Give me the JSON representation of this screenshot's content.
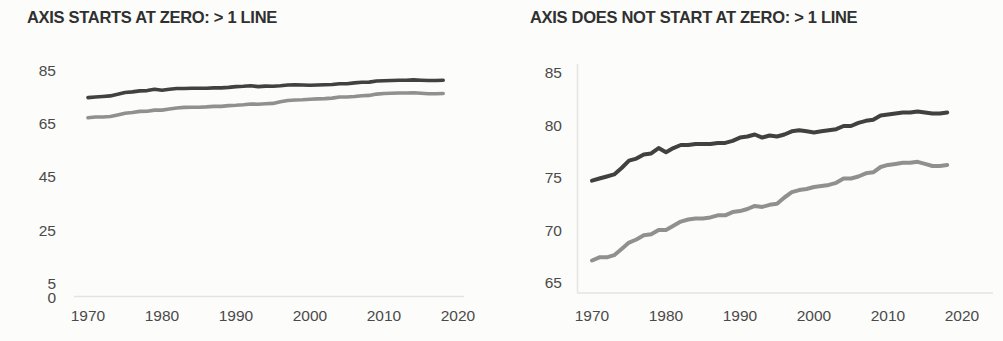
{
  "page": {
    "background_color": "#fcfcfa"
  },
  "chart_data": [
    {
      "id": "axis-starts-at-zero",
      "type": "line",
      "title": "AXIS STARTS AT ZERO: > 1 LINE",
      "xlabel": "",
      "ylabel": "",
      "xlim": [
        1970,
        2020
      ],
      "ylim": [
        0,
        88
      ],
      "x_ticks": [
        1970,
        1980,
        1990,
        2000,
        2010,
        2020
      ],
      "y_ticks": [
        85,
        65,
        45,
        25,
        5,
        0
      ],
      "grid": false,
      "legend": "none",
      "axis_color": "#e4e4e0",
      "tick_color": "#4a4a4a",
      "title_color": "#303030",
      "x": [
        1970,
        1971,
        1972,
        1973,
        1974,
        1975,
        1976,
        1977,
        1978,
        1979,
        1980,
        1981,
        1982,
        1983,
        1984,
        1985,
        1986,
        1987,
        1988,
        1989,
        1990,
        1991,
        1992,
        1993,
        1994,
        1995,
        1996,
        1997,
        1998,
        1999,
        2000,
        2001,
        2002,
        2003,
        2004,
        2005,
        2006,
        2007,
        2008,
        2009,
        2010,
        2011,
        2012,
        2013,
        2014,
        2015,
        2016,
        2017,
        2018
      ],
      "series": [
        {
          "name": "dark-line",
          "color": "#414141",
          "stroke_width": 3.6,
          "values": [
            74.7,
            74.9,
            75.1,
            75.3,
            75.9,
            76.6,
            76.8,
            77.2,
            77.3,
            77.8,
            77.4,
            77.8,
            78.1,
            78.1,
            78.2,
            78.2,
            78.2,
            78.3,
            78.3,
            78.5,
            78.8,
            78.9,
            79.1,
            78.8,
            79.0,
            78.9,
            79.1,
            79.4,
            79.5,
            79.4,
            79.3,
            79.4,
            79.5,
            79.6,
            79.9,
            79.9,
            80.2,
            80.4,
            80.5,
            80.9,
            81.0,
            81.1,
            81.2,
            81.2,
            81.3,
            81.2,
            81.1,
            81.1,
            81.2
          ]
        },
        {
          "name": "light-line",
          "color": "#909090",
          "stroke_width": 3.6,
          "values": [
            67.1,
            67.4,
            67.4,
            67.6,
            68.2,
            68.8,
            69.1,
            69.5,
            69.6,
            70.0,
            70.0,
            70.4,
            70.8,
            71.0,
            71.1,
            71.1,
            71.2,
            71.4,
            71.4,
            71.7,
            71.8,
            72.0,
            72.3,
            72.2,
            72.4,
            72.5,
            73.1,
            73.6,
            73.8,
            73.9,
            74.1,
            74.2,
            74.3,
            74.5,
            74.9,
            74.9,
            75.1,
            75.4,
            75.5,
            76.0,
            76.2,
            76.3,
            76.4,
            76.4,
            76.5,
            76.3,
            76.1,
            76.1,
            76.2
          ]
        }
      ]
    },
    {
      "id": "axis-does-not-start-at-zero",
      "type": "line",
      "title": "AXIS DOES NOT START AT ZERO: > 1 LINE",
      "xlabel": "",
      "ylabel": "",
      "xlim": [
        1970,
        2020
      ],
      "ylim": [
        64.5,
        86
      ],
      "x_ticks": [
        1970,
        1980,
        1990,
        2000,
        2010,
        2020
      ],
      "y_ticks": [
        85,
        80,
        75,
        70,
        65
      ],
      "grid": false,
      "legend": "none",
      "axis_color": "#e4e4e0",
      "tick_color": "#4a4a4a",
      "title_color": "#303030",
      "x": [
        1970,
        1971,
        1972,
        1973,
        1974,
        1975,
        1976,
        1977,
        1978,
        1979,
        1980,
        1981,
        1982,
        1983,
        1984,
        1985,
        1986,
        1987,
        1988,
        1989,
        1990,
        1991,
        1992,
        1993,
        1994,
        1995,
        1996,
        1997,
        1998,
        1999,
        2000,
        2001,
        2002,
        2003,
        2004,
        2005,
        2006,
        2007,
        2008,
        2009,
        2010,
        2011,
        2012,
        2013,
        2014,
        2015,
        2016,
        2017,
        2018
      ],
      "series": [
        {
          "name": "dark-line",
          "color": "#414141",
          "stroke_width": 4,
          "values": [
            74.7,
            74.9,
            75.1,
            75.3,
            75.9,
            76.6,
            76.8,
            77.2,
            77.3,
            77.8,
            77.4,
            77.8,
            78.1,
            78.1,
            78.2,
            78.2,
            78.2,
            78.3,
            78.3,
            78.5,
            78.8,
            78.9,
            79.1,
            78.8,
            79.0,
            78.9,
            79.1,
            79.4,
            79.5,
            79.4,
            79.3,
            79.4,
            79.5,
            79.6,
            79.9,
            79.9,
            80.2,
            80.4,
            80.5,
            80.9,
            81.0,
            81.1,
            81.2,
            81.2,
            81.3,
            81.2,
            81.1,
            81.1,
            81.2
          ]
        },
        {
          "name": "light-line",
          "color": "#909090",
          "stroke_width": 4,
          "values": [
            67.1,
            67.4,
            67.4,
            67.6,
            68.2,
            68.8,
            69.1,
            69.5,
            69.6,
            70.0,
            70.0,
            70.4,
            70.8,
            71.0,
            71.1,
            71.1,
            71.2,
            71.4,
            71.4,
            71.7,
            71.8,
            72.0,
            72.3,
            72.2,
            72.4,
            72.5,
            73.1,
            73.6,
            73.8,
            73.9,
            74.1,
            74.2,
            74.3,
            74.5,
            74.9,
            74.9,
            75.1,
            75.4,
            75.5,
            76.0,
            76.2,
            76.3,
            76.4,
            76.4,
            76.5,
            76.3,
            76.1,
            76.1,
            76.2
          ]
        }
      ]
    }
  ]
}
